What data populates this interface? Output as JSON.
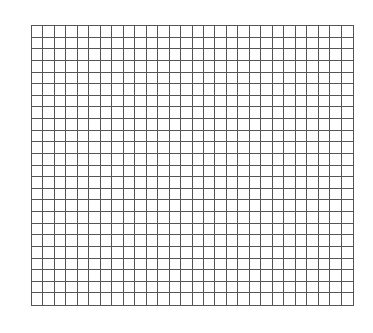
{
  "grid": {
    "columns": 28,
    "rows": 24,
    "line_color": "#555555",
    "background": "#ffffff"
  }
}
